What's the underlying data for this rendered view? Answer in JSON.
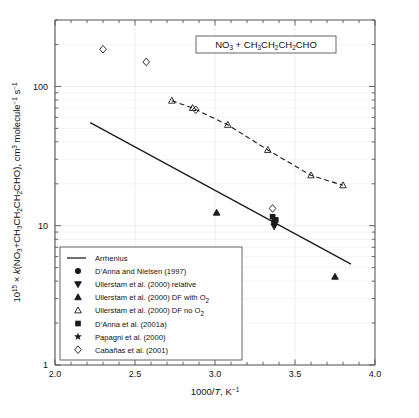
{
  "figure": {
    "title_box": "NO3 + CH3CH2CH2CHO",
    "title_parts": [
      {
        "t": "NO",
        "sub": "3"
      },
      {
        "t": " + CH",
        "sub": "3"
      },
      {
        "t": "CH",
        "sub": "2"
      },
      {
        "t": "CH",
        "sub": "2"
      },
      {
        "t": "CHO",
        "sub": ""
      }
    ],
    "xlabel": "1000/T, K-1",
    "ylabel": "1015 x k(NO3+CH3CH2CH2CHO), cm3 molecule-1 s-1"
  },
  "chart_data": {
    "type": "scatter",
    "title": "NO3 + CH3CH2CH2CHO",
    "xlabel": "1000/T, K⁻¹",
    "ylabel": "10¹⁵ × k(NO₃+CH₃CH₂CH₂CHO), cm³ molecule⁻¹ s⁻¹",
    "xlim": [
      2.0,
      4.0
    ],
    "ylim": [
      1,
      300
    ],
    "xscale": "linear",
    "yscale": "log",
    "grid": true,
    "legend_position": "lower-left",
    "xticks": [
      "2.0",
      "2.5",
      "3.0",
      "3.5",
      "4.0"
    ],
    "xtick_values": [
      2.0,
      2.5,
      3.0,
      3.5,
      4.0
    ],
    "yticks": [
      "1",
      "10",
      "100"
    ],
    "ytick_values": [
      1,
      10,
      100
    ],
    "series": [
      {
        "name": "Arrhenius",
        "marker": "line",
        "style": "solid",
        "points": [
          [
            2.22,
            55.0
          ],
          [
            3.85,
            5.3
          ]
        ]
      },
      {
        "name": "D'Anna and Nielsen (1997)",
        "marker": "filled-circle",
        "points": [
          [
            3.37,
            10.6
          ]
        ]
      },
      {
        "name": "Ullerstam et al. (2000) relative",
        "marker": "filled-down-triangle",
        "points": [
          [
            3.37,
            9.9
          ]
        ]
      },
      {
        "name": "Ullerstam et al. (2000) DF with O2",
        "marker": "filled-up-triangle",
        "points": [
          [
            3.01,
            12.4
          ],
          [
            3.75,
            4.3
          ]
        ]
      },
      {
        "name": "Ullerstam et al. (2000) DF no O2",
        "marker": "open-up-triangle",
        "style": "dashed",
        "points": [
          [
            2.73,
            79.0
          ],
          [
            2.86,
            70.0
          ],
          [
            3.08,
            53.0
          ],
          [
            3.33,
            35.0
          ],
          [
            3.6,
            23.0
          ],
          [
            3.8,
            19.5
          ]
        ]
      },
      {
        "name": "D'Anna et al. (2001a)",
        "marker": "filled-square",
        "points": [
          [
            3.36,
            11.6
          ],
          [
            3.38,
            11.0
          ]
        ]
      },
      {
        "name": "Papagni et al. (2000)",
        "marker": "filled-star",
        "points": [
          [
            3.37,
            11.2
          ]
        ]
      },
      {
        "name": "Cabañas et al. (2001)",
        "marker": "open-diamond",
        "points": [
          [
            2.3,
            185.0
          ],
          [
            2.57,
            150.0
          ],
          [
            2.88,
            68.0
          ],
          [
            3.36,
            13.3
          ]
        ]
      }
    ]
  },
  "legend": {
    "items": [
      {
        "marker": "line",
        "label": "Arrhenius"
      },
      {
        "marker": "filled-circle",
        "label": "D’Anna and Nielsen (1997)"
      },
      {
        "marker": "filled-down-triangle",
        "label": "Ullerstam et al. (2000) relative"
      },
      {
        "marker": "filled-up-triangle",
        "label": "Ullerstam et al. (2000) DF with O2"
      },
      {
        "marker": "open-up-triangle",
        "label": "Ullerstam et al. (2000) DF no O2"
      },
      {
        "marker": "filled-square",
        "label": "D’Anna et al. (2001a)"
      },
      {
        "marker": "filled-star",
        "label": "Papagni et al. (2000)"
      },
      {
        "marker": "open-diamond",
        "label": "Cabañas et al. (2001)"
      }
    ]
  },
  "colors": {
    "axis": "#555555",
    "grid": "#e8e8e8",
    "data": "#1a1a1a",
    "background": "#ffffff"
  }
}
